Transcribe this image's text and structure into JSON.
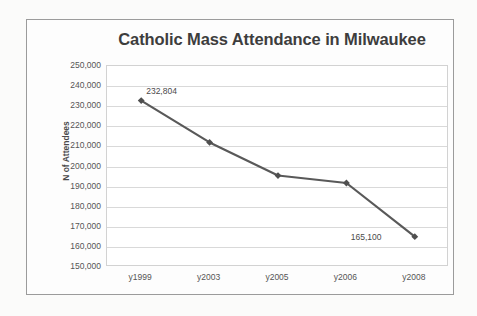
{
  "chart_data": {
    "type": "line",
    "title": "Catholic Mass Attendance in Milwaukee",
    "xlabel": "",
    "ylabel": "N of Attendees",
    "categories": [
      "y1999",
      "y2003",
      "y2005",
      "y2006",
      "y2008"
    ],
    "values": [
      232804,
      212000,
      195500,
      191800,
      165100
    ],
    "point_labels": [
      "232,804",
      "",
      "",
      "",
      "165,100"
    ],
    "ylim": [
      150000,
      250000
    ],
    "ytick_step": 10000,
    "ytick_labels": [
      "250,000",
      "240,000",
      "230,000",
      "220,000",
      "210,000",
      "200,000",
      "190,000",
      "180,000",
      "170,000",
      "160,000",
      "150,000"
    ],
    "grid": "horizontal",
    "legend": "none",
    "series": [
      {
        "name": "N of Attendees",
        "values": [
          232804,
          212000,
          195500,
          191800,
          165100
        ],
        "color": "#595959",
        "marker": "diamond"
      }
    ]
  },
  "colors": {
    "series_line": "#595959",
    "marker": "#4f4f4f",
    "gridline": "#d9d9d9",
    "frame_border": "#9b9b9b",
    "plot_border": "#d2d2d2",
    "title_text": "#3d3d3d",
    "tick_text": "#555555",
    "page_background": "#fbfbfa"
  }
}
